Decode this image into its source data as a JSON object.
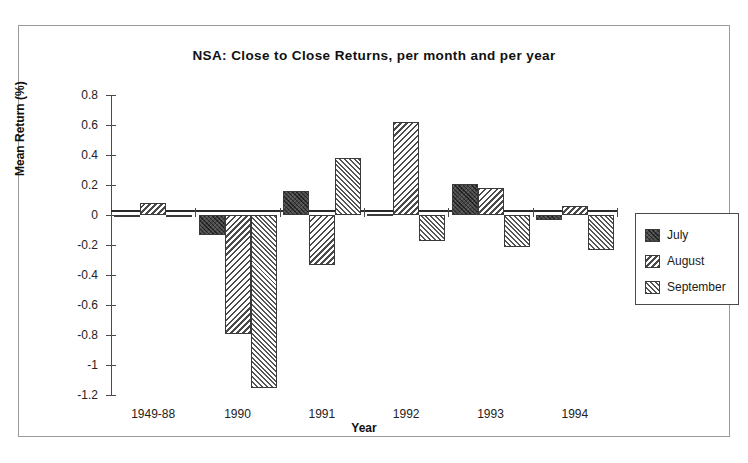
{
  "figure": {
    "y_axis_title": "Mean Return (%)",
    "x_axis_title": "Year"
  },
  "legend": {
    "items": [
      {
        "label": "July",
        "pattern": "dark-crosshatch",
        "color": "#4a4a4a"
      },
      {
        "label": "August",
        "pattern": "diagonal-hatch-back",
        "color": "#4a4a4a"
      },
      {
        "label": "September",
        "pattern": "diagonal-hatch-fwd",
        "color": "#555555"
      }
    ]
  },
  "chart_data": {
    "type": "bar",
    "title": "NSA: Close to Close Returns, per month and per year",
    "xlabel": "Year",
    "ylabel": "Mean Return (%)",
    "categories": [
      "1949-88",
      "1990",
      "1991",
      "1992",
      "1993",
      "1994"
    ],
    "series": [
      {
        "name": "July",
        "values": [
          0.0,
          -0.13,
          0.16,
          0.01,
          0.21,
          -0.03
        ]
      },
      {
        "name": "August",
        "values": [
          0.08,
          -0.79,
          -0.33,
          0.62,
          0.18,
          0.06
        ]
      },
      {
        "name": "September",
        "values": [
          0.0,
          -1.15,
          0.38,
          -0.17,
          -0.21,
          -0.23
        ]
      }
    ],
    "ylim": [
      -1.2,
      0.8
    ],
    "ytick_labels": [
      "0.8",
      "0.6",
      "0.4",
      "0.2",
      "0",
      "-0.2",
      "-0.4",
      "-0.6",
      "-0.8",
      "-1",
      "-1.2"
    ],
    "ytick_values": [
      0.8,
      0.6,
      0.4,
      0.2,
      0,
      -0.2,
      -0.4,
      -0.6,
      -0.8,
      -1.0,
      -1.2
    ],
    "grid": false,
    "legend_position": "right"
  }
}
